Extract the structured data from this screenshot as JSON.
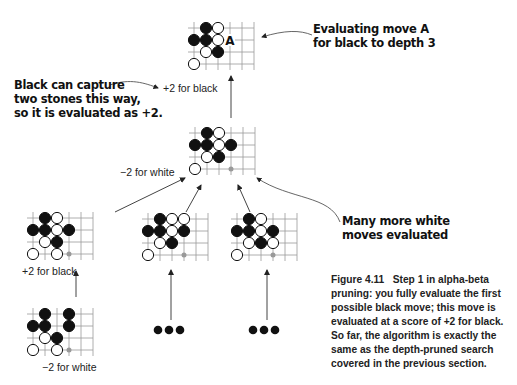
{
  "callouts": {
    "top_right": "Evaluating move A\nfor black to depth 3",
    "left": "Black can capture\ntwo stones this way,\nso it is evaluated as +2.",
    "right": "Many more white\nmoves evaluated"
  },
  "scores": {
    "root_edge": "+2 for black",
    "mid_board": "−2 for white",
    "leaf1_edge": "+2 for black",
    "leaf_bottom": "−2 for white"
  },
  "move_label": "A",
  "caption": {
    "figure": "Figure 4.11",
    "text": "Step 1 in alpha-beta pruning: you fully evaluate the first possible black move; this move is evaluated at a score of +2 for black. So far, the algorithm is exactly the same as the depth-pruned search covered in the previous section."
  },
  "boards": [
    {
      "id": "root",
      "x": 194,
      "y": 28,
      "stones": [
        [
          1,
          0,
          "b"
        ],
        [
          2,
          0,
          "w"
        ],
        [
          0,
          1,
          "b"
        ],
        [
          1,
          1,
          "b"
        ],
        [
          2,
          1,
          "w"
        ],
        [
          1,
          2,
          "w"
        ],
        [
          2,
          2,
          "b"
        ],
        [
          0,
          3,
          "w"
        ]
      ],
      "marker": [
        3,
        1
      ],
      "label_at": [
        3,
        1
      ]
    },
    {
      "id": "mid",
      "x": 195,
      "y": 133,
      "stones": [
        [
          1,
          0,
          "b"
        ],
        [
          2,
          0,
          "w"
        ],
        [
          0,
          1,
          "b"
        ],
        [
          1,
          1,
          "b"
        ],
        [
          2,
          1,
          "w"
        ],
        [
          3,
          1,
          "b"
        ],
        [
          1,
          2,
          "w"
        ],
        [
          2,
          2,
          "b"
        ],
        [
          0,
          3,
          "w"
        ]
      ],
      "marker": [
        3,
        3
      ]
    },
    {
      "id": "child1",
      "x": 33,
      "y": 218,
      "stones": [
        [
          1,
          0,
          "b"
        ],
        [
          2,
          0,
          "w"
        ],
        [
          0,
          1,
          "b"
        ],
        [
          1,
          1,
          "b"
        ],
        [
          2,
          1,
          "w"
        ],
        [
          3,
          1,
          "b"
        ],
        [
          1,
          2,
          "w"
        ],
        [
          2,
          2,
          "b"
        ],
        [
          0,
          3,
          "w"
        ],
        [
          2,
          3,
          "w"
        ]
      ],
      "marker": [
        3,
        3
      ]
    },
    {
      "id": "child2",
      "x": 148,
      "y": 219,
      "stones": [
        [
          1,
          0,
          "b"
        ],
        [
          2,
          0,
          "w"
        ],
        [
          3,
          0,
          "w"
        ],
        [
          0,
          1,
          "b"
        ],
        [
          1,
          1,
          "b"
        ],
        [
          2,
          1,
          "w"
        ],
        [
          3,
          1,
          "b"
        ],
        [
          1,
          2,
          "w"
        ],
        [
          2,
          2,
          "b"
        ],
        [
          0,
          3,
          "w"
        ]
      ],
      "marker": [
        3,
        3
      ]
    },
    {
      "id": "child3",
      "x": 237,
      "y": 219,
      "stones": [
        [
          1,
          0,
          "b"
        ],
        [
          2,
          0,
          "w"
        ],
        [
          0,
          1,
          "b"
        ],
        [
          1,
          1,
          "b"
        ],
        [
          2,
          1,
          "w"
        ],
        [
          3,
          1,
          "b"
        ],
        [
          1,
          2,
          "w"
        ],
        [
          2,
          2,
          "b"
        ],
        [
          3,
          2,
          "w"
        ],
        [
          0,
          3,
          "w"
        ]
      ],
      "marker": [
        3,
        3
      ]
    },
    {
      "id": "grandchild",
      "x": 33,
      "y": 314,
      "stones": [
        [
          1,
          0,
          "b"
        ],
        [
          3,
          0,
          "b"
        ],
        [
          0,
          1,
          "b"
        ],
        [
          1,
          1,
          "b"
        ],
        [
          3,
          1,
          "b"
        ],
        [
          1,
          2,
          "w"
        ],
        [
          2,
          2,
          "b"
        ],
        [
          0,
          3,
          "w"
        ],
        [
          2,
          3,
          "w"
        ]
      ],
      "marker": [
        3,
        3
      ]
    }
  ],
  "ellipses": [
    {
      "id": "ellipsis-1",
      "x": 158,
      "y": 330
    },
    {
      "id": "ellipsis-2",
      "x": 253,
      "y": 330
    }
  ]
}
